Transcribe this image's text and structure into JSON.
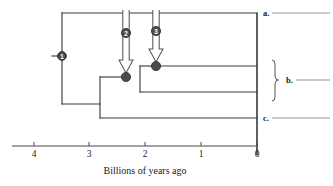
{
  "figure": {
    "type": "phylogenetic-tree-timeline",
    "axis": {
      "title": "Billions of years ago",
      "ticks": [
        {
          "label": "4",
          "value": 4,
          "x": 34
        },
        {
          "label": "3",
          "value": 3,
          "x": 89
        },
        {
          "label": "2",
          "value": 2,
          "x": 145
        },
        {
          "label": "1",
          "value": 1,
          "x": 201
        },
        {
          "label": "0",
          "value": 0,
          "x": 257
        }
      ],
      "line_y": 146,
      "x_min_value": 4.4,
      "x_max_value": 0
    },
    "taxon_labels": [
      {
        "id": "a",
        "label": "a.",
        "x": 263,
        "y": 13,
        "line_from": 272,
        "line_to": 330
      },
      {
        "id": "b",
        "label": "b.",
        "x": 286,
        "y": 80,
        "line_from": 296,
        "line_to": 330
      },
      {
        "id": "c",
        "label": "c.",
        "x": 263,
        "y": 118,
        "line_from": 272,
        "line_to": 330
      }
    ],
    "bracket": {
      "name": "clade-b-bracket",
      "x": 275,
      "y_top": 60,
      "y_bottom": 101,
      "y_mid": 80
    },
    "event_markers": [
      {
        "number": "1",
        "cx": 62,
        "cy": 56,
        "r": 4.2,
        "has_arrow": false,
        "tick_x_from": 52,
        "tick_x_to": 62
      },
      {
        "number": "2",
        "cx": 126,
        "cy": 33,
        "r": 4.6,
        "has_arrow": true,
        "arrow_top": 10,
        "arrow_tip_y": 73,
        "shaft_half_width": 3.2,
        "head_half_width": 7.0,
        "head_top_y": 60
      },
      {
        "number": "3",
        "cx": 156,
        "cy": 31,
        "r": 4.6,
        "has_arrow": true,
        "arrow_top": 10,
        "arrow_tip_y": 62,
        "shaft_half_width": 3.2,
        "head_half_width": 7.0,
        "head_top_y": 49
      }
    ],
    "tree_nodes": [
      {
        "name": "root-node-1",
        "cx": 62,
        "cy": 56,
        "r": 4.2
      },
      {
        "name": "node-2-endosymbiosis",
        "cx": 126,
        "cy": 77,
        "r": 4.6
      },
      {
        "name": "node-3-endosymbiosis",
        "cx": 156,
        "cy": 66,
        "r": 4.6
      }
    ],
    "branches": [
      {
        "name": "root-stem",
        "points": "52,56 62,56"
      },
      {
        "name": "root-vertical",
        "points": "62,13 62,104"
      },
      {
        "name": "branch-to-a",
        "points": "62,13 257,13"
      },
      {
        "name": "branch-root-lower",
        "points": "62,104 100,104"
      },
      {
        "name": "clade-vertical-mid",
        "points": "100,77 100,118"
      },
      {
        "name": "branch-to-node2",
        "points": "100,77 126,77"
      },
      {
        "name": "branch-to-c",
        "points": "100,118 257,118"
      },
      {
        "name": "node2-vertical",
        "points": "140,66 140,92"
      },
      {
        "name": "branch-node2-to-node3",
        "points": "140,66 156,66"
      },
      {
        "name": "branch-b-lower",
        "points": "140,92 257,92"
      },
      {
        "name": "branch-b-upper",
        "points": "156,66 257,66"
      },
      {
        "name": "present-day-axis",
        "points": "257,13 257,155"
      }
    ],
    "colors": {
      "branch_stroke": "#3d3d3d",
      "marker_fill": "#4a4a4a",
      "marker_stroke": "#2b2b2b",
      "arrow_outline": "#555555",
      "axis_stroke": "#4a4a4a",
      "label_line": "#777777",
      "text": "#1a1a1a"
    }
  }
}
